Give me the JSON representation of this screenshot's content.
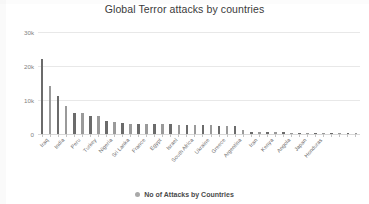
{
  "chart_data": {
    "type": "bar",
    "title": "Global Terror attacks by countries",
    "xlabel": "",
    "ylabel": "",
    "ylim": [
      0,
      30000
    ],
    "yticks": [
      0,
      10000,
      20000,
      30000
    ],
    "ytick_labels": [
      "0",
      "10k",
      "20k",
      "30k"
    ],
    "grid": true,
    "legend_position": "bottom",
    "series_name": "No of Attacks by Countries",
    "bar_color": "#777777",
    "categories": [
      "Iraq",
      "Afghanistan",
      "India",
      "Pakistan",
      "Peru",
      "Colombia",
      "Turkey",
      "Philippines",
      "Nigeria",
      "Somalia",
      "Sri Lanka",
      "Thailand",
      "France",
      "Yemen",
      "Egypt",
      "Syria",
      "Israel",
      "Algeria",
      "South Africa",
      "Lebanon",
      "Ukraine",
      "Chile",
      "Greece",
      "Russia",
      "Argentina",
      "Nepal",
      "Iran",
      "Bangladesh",
      "Kenya",
      "Libya",
      "Angola",
      "Indonesia",
      "Japan",
      "Guatemala",
      "Honduras",
      "Uganda",
      "Bolivia",
      "Mexico",
      "Cambodia",
      "Paraguay"
    ],
    "values": [
      22100,
      14000,
      11200,
      8100,
      6200,
      6100,
      5400,
      5300,
      3700,
      3600,
      3100,
      3050,
      3000,
      2950,
      2900,
      2850,
      2800,
      2750,
      2700,
      2650,
      2600,
      2550,
      2500,
      2450,
      2400,
      1200,
      700,
      600,
      550,
      500,
      450,
      420,
      400,
      380,
      350,
      330,
      300,
      280,
      260,
      240
    ],
    "visible_tick_labels": [
      {
        "index": 0,
        "label": "Iraq"
      },
      {
        "index": 2,
        "label": "India"
      },
      {
        "index": 4,
        "label": "Peru"
      },
      {
        "index": 6,
        "label": "Turkey"
      },
      {
        "index": 8,
        "label": "Nigeria"
      },
      {
        "index": 10,
        "label": "Sri Lanka"
      },
      {
        "index": 12,
        "label": "France"
      },
      {
        "index": 14,
        "label": "Egypt"
      },
      {
        "index": 16,
        "label": "Israel"
      },
      {
        "index": 18,
        "label": "South Africa"
      },
      {
        "index": 20,
        "label": "Ukraine"
      },
      {
        "index": 22,
        "label": "Greece"
      },
      {
        "index": 24,
        "label": "Argentina"
      },
      {
        "index": 26,
        "label": "Iran"
      },
      {
        "index": 28,
        "label": "Kenya"
      },
      {
        "index": 30,
        "label": "Angola"
      },
      {
        "index": 32,
        "label": "Japan"
      },
      {
        "index": 34,
        "label": "Honduras"
      }
    ]
  },
  "legend": {
    "label": "No of Attacks by Countries",
    "marker": "circle-marker"
  }
}
